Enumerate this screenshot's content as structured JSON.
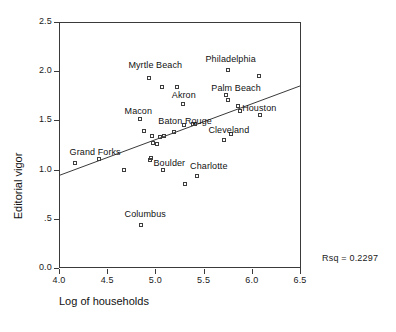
{
  "chart_data": {
    "type": "scatter",
    "title": "",
    "xlabel": "Log of households",
    "ylabel": "Editorial vigor",
    "xlim": [
      4.0,
      6.5
    ],
    "ylim": [
      0.0,
      2.5
    ],
    "grid": false,
    "legend": "none",
    "xticks": [
      "4.0",
      "4.5",
      "5.0",
      "5.5",
      "6.0",
      "6.5"
    ],
    "xtick_values": [
      4.0,
      4.5,
      5.0,
      5.5,
      6.0,
      6.5
    ],
    "yticks": [
      "0.0",
      ".5",
      "1.0",
      "1.5",
      "2.0",
      "2.5"
    ],
    "ytick_values": [
      0.0,
      0.5,
      1.0,
      1.5,
      2.0,
      2.5
    ],
    "annotations": [
      {
        "name": "rsq",
        "text": "Rsq = 0.2297"
      }
    ],
    "fit_line": {
      "type": "linear_regression",
      "x_start": 4.0,
      "y_start": 0.94,
      "x_end": 6.5,
      "y_end": 1.85
    },
    "points": [
      {
        "x": 4.17,
        "y": 1.07,
        "label": ""
      },
      {
        "x": 4.41,
        "y": 1.11,
        "label": ""
      },
      {
        "x": 4.67,
        "y": 1.0,
        "label": ""
      },
      {
        "x": 4.84,
        "y": 1.51,
        "label": ""
      },
      {
        "x": 4.85,
        "y": 0.44,
        "label": ""
      },
      {
        "x": 4.88,
        "y": 1.39,
        "label": ""
      },
      {
        "x": 4.93,
        "y": 1.93,
        "label": ""
      },
      {
        "x": 4.94,
        "y": 1.1,
        "label": ""
      },
      {
        "x": 4.95,
        "y": 1.12,
        "label": ""
      },
      {
        "x": 4.96,
        "y": 1.34,
        "label": ""
      },
      {
        "x": 4.97,
        "y": 1.27,
        "label": ""
      },
      {
        "x": 5.02,
        "y": 1.26,
        "label": ""
      },
      {
        "x": 5.05,
        "y": 1.33,
        "label": ""
      },
      {
        "x": 5.07,
        "y": 1.84,
        "label": ""
      },
      {
        "x": 5.08,
        "y": 1.0,
        "label": ""
      },
      {
        "x": 5.09,
        "y": 1.34,
        "label": ""
      },
      {
        "x": 5.19,
        "y": 1.38,
        "label": ""
      },
      {
        "x": 5.22,
        "y": 1.84,
        "label": ""
      },
      {
        "x": 5.29,
        "y": 1.67,
        "label": ""
      },
      {
        "x": 5.3,
        "y": 1.45,
        "label": ""
      },
      {
        "x": 5.31,
        "y": 0.85,
        "label": ""
      },
      {
        "x": 5.39,
        "y": 1.46,
        "label": ""
      },
      {
        "x": 5.41,
        "y": 1.46,
        "label": ""
      },
      {
        "x": 5.43,
        "y": 0.93,
        "label": ""
      },
      {
        "x": 5.71,
        "y": 1.3,
        "label": ""
      },
      {
        "x": 5.73,
        "y": 1.76,
        "label": ""
      },
      {
        "x": 5.75,
        "y": 2.01,
        "label": ""
      },
      {
        "x": 5.75,
        "y": 1.71,
        "label": ""
      },
      {
        "x": 5.78,
        "y": 1.36,
        "label": ""
      },
      {
        "x": 5.86,
        "y": 1.65,
        "label": ""
      },
      {
        "x": 5.88,
        "y": 1.6,
        "label": ""
      },
      {
        "x": 6.07,
        "y": 1.95,
        "label": ""
      },
      {
        "x": 6.08,
        "y": 1.55,
        "label": ""
      }
    ],
    "point_labels": [
      {
        "text": "Myrtle Beach",
        "x": 4.72,
        "y": 2.06
      },
      {
        "text": "Philadelphia",
        "x": 5.52,
        "y": 2.12
      },
      {
        "text": "Palm Beach",
        "x": 5.58,
        "y": 1.83
      },
      {
        "text": "Akron",
        "x": 5.17,
        "y": 1.76
      },
      {
        "text": "Houston",
        "x": 5.9,
        "y": 1.63
      },
      {
        "text": "Macon",
        "x": 4.68,
        "y": 1.6
      },
      {
        "text": "Baton Rouge",
        "x": 5.03,
        "y": 1.49
      },
      {
        "text": "Cleveland",
        "x": 5.55,
        "y": 1.4
      },
      {
        "text": "Grand Forks",
        "x": 4.11,
        "y": 1.18
      },
      {
        "text": "Boulder",
        "x": 4.98,
        "y": 1.07
      },
      {
        "text": "Charlotte",
        "x": 5.36,
        "y": 1.04
      },
      {
        "text": "Columbus",
        "x": 4.68,
        "y": 0.55
      }
    ]
  }
}
